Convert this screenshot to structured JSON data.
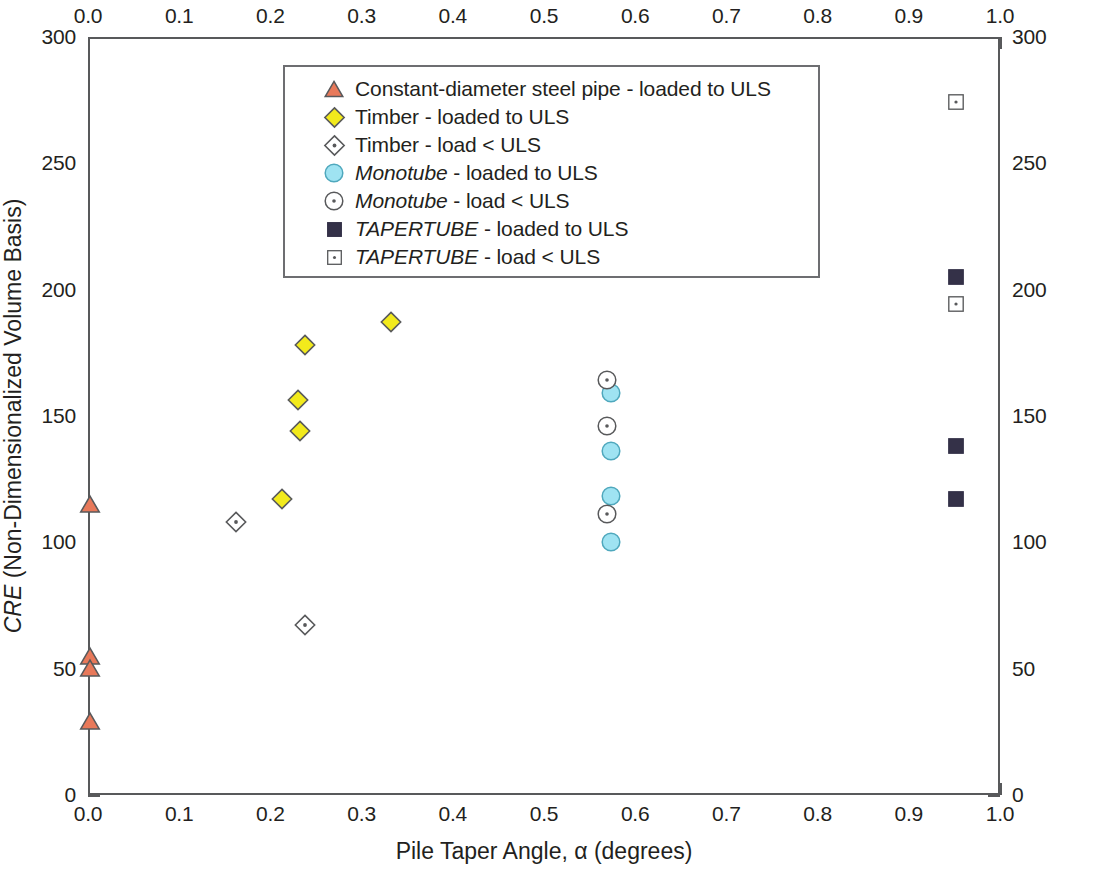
{
  "chart_data": {
    "type": "scatter",
    "title": "",
    "xlabel": "Pile Taper Angle, α (degrees)",
    "ylabel": "CRE (Non-Dimensionalized Volume Basis)",
    "ylabel_italic_prefix": "CRE",
    "ylabel_rest": " (Non-Dimensionalized Volume Basis)",
    "xlim": [
      0.0,
      1.0
    ],
    "ylim": [
      0,
      300
    ],
    "x_ticks": [
      "0.0",
      "0.1",
      "0.2",
      "0.3",
      "0.4",
      "0.5",
      "0.6",
      "0.7",
      "0.8",
      "0.9",
      "1.0"
    ],
    "x_tick_values": [
      0.0,
      0.1,
      0.2,
      0.3,
      0.4,
      0.5,
      0.6,
      0.7,
      0.8,
      0.9,
      1.0
    ],
    "x_minor_step": 0.02,
    "y_ticks": [
      "0",
      "50",
      "100",
      "150",
      "200",
      "250",
      "300"
    ],
    "y_tick_values": [
      0,
      50,
      100,
      150,
      200,
      250,
      300
    ],
    "y_minor_step": 10,
    "grid": false,
    "top_axis": true,
    "right_axis": true,
    "legend_position": "upper-center-inside",
    "series": [
      {
        "name": "Constant-diameter steel pipe - loaded to ULS",
        "marker": "triangle-filled",
        "fill": "#e8795a",
        "stroke": "#58595b",
        "points": [
          {
            "x": 0.0,
            "y": 116
          },
          {
            "x": 0.0,
            "y": 56
          },
          {
            "x": 0.0,
            "y": 51
          },
          {
            "x": 0.0,
            "y": 30
          }
        ]
      },
      {
        "name": "Timber - loaded to ULS",
        "marker": "diamond-filled",
        "fill": "#f2ea1c",
        "stroke": "#58595b",
        "points": [
          {
            "x": 0.21,
            "y": 118
          },
          {
            "x": 0.23,
            "y": 145
          },
          {
            "x": 0.228,
            "y": 157
          },
          {
            "x": 0.236,
            "y": 179
          },
          {
            "x": 0.33,
            "y": 188
          }
        ]
      },
      {
        "name": "Timber - load < ULS",
        "marker": "diamond-open-dot",
        "fill": "#ffffff",
        "stroke": "#58595b",
        "points": [
          {
            "x": 0.16,
            "y": 109
          },
          {
            "x": 0.236,
            "y": 68
          }
        ]
      },
      {
        "name": "Monotube - loaded to ULS",
        "marker": "circle-filled",
        "fill": "#9fe3f2",
        "stroke": "#4fa8bd",
        "italic_name": true,
        "points": [
          {
            "x": 0.571,
            "y": 160
          },
          {
            "x": 0.571,
            "y": 137
          },
          {
            "x": 0.571,
            "y": 119
          },
          {
            "x": 0.571,
            "y": 101
          }
        ]
      },
      {
        "name": "Monotube - load < ULS",
        "marker": "circle-open-dot",
        "fill": "#ffffff",
        "stroke": "#58595b",
        "italic_name": true,
        "points": [
          {
            "x": 0.567,
            "y": 165
          },
          {
            "x": 0.567,
            "y": 147
          },
          {
            "x": 0.567,
            "y": 112
          }
        ]
      },
      {
        "name": "TAPERTUBE - loaded to ULS",
        "marker": "square-filled",
        "fill": "#343148",
        "stroke": "#343148",
        "italic_name": true,
        "points": [
          {
            "x": 0.95,
            "y": 206
          },
          {
            "x": 0.95,
            "y": 139
          },
          {
            "x": 0.95,
            "y": 118
          }
        ]
      },
      {
        "name": "TAPERTUBE - load < ULS",
        "marker": "square-open-dot",
        "fill": "#ffffff",
        "stroke": "#58595b",
        "italic_name": true,
        "points": [
          {
            "x": 0.95,
            "y": 275
          },
          {
            "x": 0.95,
            "y": 195
          }
        ]
      }
    ]
  },
  "legend": {
    "items": [
      {
        "label": "Constant-diameter steel pipe - loaded to ULS",
        "marker": "triangle-filled",
        "italic_head": ""
      },
      {
        "label": "Timber - loaded to ULS",
        "marker": "diamond-filled",
        "italic_head": ""
      },
      {
        "label": "Timber - load < ULS",
        "marker": "diamond-open-dot",
        "italic_head": ""
      },
      {
        "label": " - loaded to ULS",
        "marker": "circle-filled",
        "italic_head": "Monotube"
      },
      {
        "label": " - load < ULS",
        "marker": "circle-open-dot",
        "italic_head": "Monotube"
      },
      {
        "label": " - loaded to ULS",
        "marker": "square-filled",
        "italic_head": "TAPERTUBE"
      },
      {
        "label": " - load < ULS",
        "marker": "square-open-dot",
        "italic_head": "TAPERTUBE"
      }
    ]
  },
  "axes": {
    "x_title": "Pile Taper Angle, α (degrees)",
    "y_title_italic": "CRE",
    "y_title_rest": " (Non-Dimensionalized Volume Basis)"
  },
  "colors": {
    "steel_pipe": "#e8795a",
    "timber": "#f2ea1c",
    "monotube": "#9fe3f2",
    "tapertube": "#343148",
    "axis": "#58595b",
    "text": "#231f20"
  }
}
